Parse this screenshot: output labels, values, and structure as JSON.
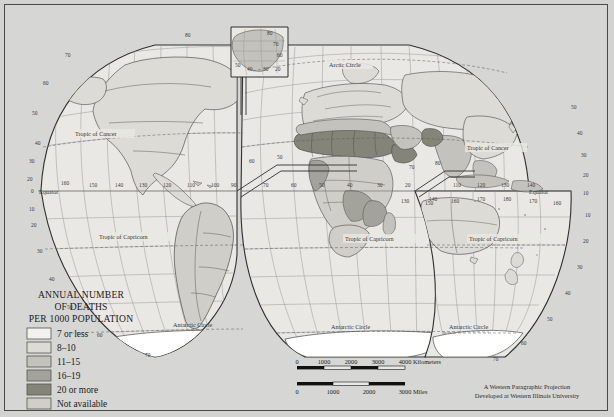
{
  "map": {
    "title_lines": [
      "ANNUAL NUMBER",
      "OF DEATHS",
      "PER 1000 POPULATION"
    ],
    "projection_credit": [
      "A Western Paragraphic Projection",
      "Developed at Western Illinois University"
    ],
    "background_color": "#d6d6d4",
    "frame_color": "#4a4a4a"
  },
  "legend": {
    "items": [
      {
        "label": "7 or less",
        "color": "#f2f1ee"
      },
      {
        "label": "8–10",
        "color": "#dcdbd6"
      },
      {
        "label": "11–15",
        "color": "#c3c2bc"
      },
      {
        "label": "16–19",
        "color": "#a3a29b"
      },
      {
        "label": "20 or more",
        "color": "#858479"
      },
      {
        "label": "Not available",
        "color": "#cfcec8"
      }
    ]
  },
  "scale_bars": [
    {
      "unit": "Kilometers",
      "ticks": [
        "0",
        "1000",
        "2000",
        "3000",
        "4000"
      ]
    },
    {
      "unit": "Miles",
      "ticks": [
        "0",
        "1000",
        "2000",
        "3000"
      ]
    }
  ],
  "reference_lines": [
    {
      "name": "Arctic Circle",
      "label": "Arctic Circle"
    },
    {
      "name": "Tropic of Cancer",
      "label": "Tropic of Cancer"
    },
    {
      "name": "Equator",
      "label": "Equator"
    },
    {
      "name": "Tropic of Capricorn",
      "label": "Tropic of Capricorn"
    },
    {
      "name": "Antarctic Circle",
      "label": "Antarctic Circle"
    }
  ],
  "graticule": {
    "latitude_labels": [
      "80",
      "70",
      "60",
      "50",
      "40",
      "30",
      "20",
      "10",
      "0"
    ],
    "longitude_labels_west": [
      "160",
      "150",
      "140",
      "130",
      "120",
      "110",
      "100",
      "90"
    ],
    "longitude_labels_east": [
      "110",
      "120",
      "130",
      "140",
      "150",
      "160",
      "170",
      "180"
    ],
    "inset_labels": [
      "80",
      "70",
      "60",
      "50",
      "40",
      "30",
      "20",
      "10"
    ]
  },
  "inset": {
    "name": "greenland-inset"
  }
}
